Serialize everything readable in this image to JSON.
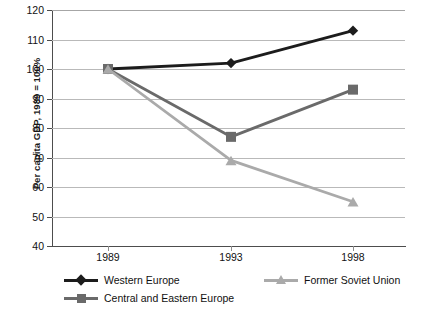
{
  "chart_data": {
    "type": "line",
    "title": "",
    "xlabel": "",
    "ylabel": "Per capita GDP, 1989 = 100%",
    "categories": [
      "1989",
      "1993",
      "1998"
    ],
    "ylim": [
      40,
      120
    ],
    "yticks": [
      40,
      50,
      60,
      70,
      80,
      90,
      100,
      110,
      120
    ],
    "ytick_labels": [
      "40",
      "50",
      "60",
      "70",
      "80",
      "90",
      "100",
      "110",
      "120"
    ],
    "grid": "horizontal",
    "legend_position": "bottom",
    "series": [
      {
        "name": "Western Europe",
        "values": [
          100,
          102,
          113
        ],
        "color": "#1c1c1c",
        "marker": "diamond"
      },
      {
        "name": "Central and Eastern Europe",
        "values": [
          100,
          77,
          93
        ],
        "color": "#6a6a6a",
        "marker": "square"
      },
      {
        "name": "Former Soviet Union",
        "values": [
          100,
          69,
          55
        ],
        "color": "#aaaaaa",
        "marker": "triangle"
      }
    ]
  },
  "axis": {
    "y_title": "Per capita GDP, 1989 = 100%",
    "y_labels": [
      "120",
      "110",
      "100",
      "90",
      "80",
      "70",
      "60",
      "50",
      "40"
    ],
    "x_labels": [
      "1989",
      "1993",
      "1998"
    ]
  },
  "legend": {
    "entries": [
      {
        "label": "Western Europe",
        "color": "#1c1c1c",
        "marker": "diamond"
      },
      {
        "label": "Central and Eastern Europe",
        "color": "#6a6a6a",
        "marker": "square"
      },
      {
        "label": "Former Soviet Union",
        "color": "#aaaaaa",
        "marker": "triangle"
      }
    ]
  },
  "colors": {
    "axis": "#4d4d4d",
    "grid": "#b9b9b9",
    "background": "#ffffff"
  }
}
